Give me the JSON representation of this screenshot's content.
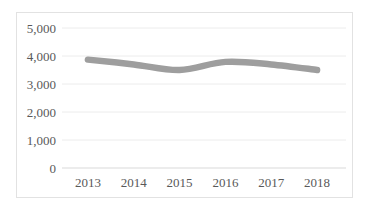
{
  "chart_data": {
    "type": "line",
    "title": "",
    "xlabel": "",
    "ylabel": "",
    "categories": [
      "2013",
      "2014",
      "2015",
      "2016",
      "2017",
      "2018"
    ],
    "series": [
      {
        "name": "",
        "values": [
          3870,
          3700,
          3500,
          3790,
          3700,
          3500
        ]
      }
    ],
    "ylim": [
      0,
      5000
    ],
    "ytick_interval": 1000,
    "ytick_labels": [
      "0",
      "1,000",
      "2,000",
      "3,000",
      "4,000",
      "5,000"
    ],
    "grid": true,
    "legend": "none",
    "smoothed_line": true,
    "line_thick": true,
    "colors": {
      "line": "#9e9e9e",
      "gridline": "#ececec",
      "axis_line": "#d9d9d9",
      "tick_label": "#595959",
      "background": "#ffffff"
    }
  }
}
